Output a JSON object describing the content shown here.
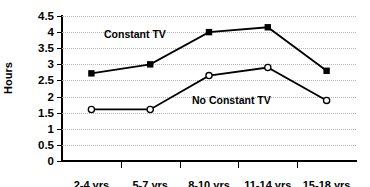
{
  "chart_data": {
    "type": "line",
    "title": "",
    "xlabel": "",
    "ylabel": "Hours",
    "categories": [
      "2-4 yrs",
      "5-7 yrs",
      "8-10 yrs",
      "11-14 yrs",
      "15-18 yrs"
    ],
    "ylim": [
      0,
      4.5
    ],
    "yticks": [
      "0",
      "0.5",
      "1",
      "1.5",
      "2",
      "2.5",
      "3",
      "3.5",
      "4",
      "4.5"
    ],
    "ytick_values": [
      0,
      0.5,
      1,
      1.5,
      2,
      2.5,
      3,
      3.5,
      4,
      4.5
    ],
    "grid": true,
    "legend_position": "inline-annotation",
    "series": [
      {
        "name": "Constant TV",
        "marker": "filled-square",
        "color": "#000000",
        "values": [
          2.72,
          3.0,
          4.0,
          4.15,
          2.8
        ]
      },
      {
        "name": "No Constant TV",
        "marker": "open-circle",
        "color": "#000000",
        "values": [
          1.6,
          1.6,
          2.65,
          2.9,
          1.88
        ]
      }
    ],
    "annotations": [
      {
        "text": "Constant TV",
        "series": "Constant TV"
      },
      {
        "text": "No Constant TV",
        "series": "No Constant TV"
      }
    ]
  }
}
